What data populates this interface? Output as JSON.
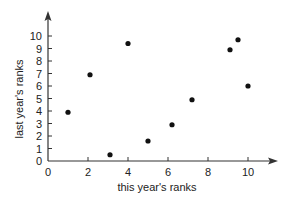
{
  "chart_data": {
    "type": "scatter",
    "title": "",
    "xlabel": "this year's ranks",
    "ylabel": "last year's ranks",
    "xlim": [
      0,
      11
    ],
    "ylim": [
      0,
      10.5
    ],
    "x_ticks": [
      0,
      2,
      4,
      6,
      8,
      10
    ],
    "y_ticks": [
      0,
      1,
      2,
      3,
      4,
      5,
      6,
      7,
      8,
      9,
      10
    ],
    "grid": false,
    "legend": null,
    "points": [
      {
        "x": 1.0,
        "y": 3.9
      },
      {
        "x": 2.1,
        "y": 6.9
      },
      {
        "x": 3.1,
        "y": 0.5
      },
      {
        "x": 4.0,
        "y": 9.4
      },
      {
        "x": 5.0,
        "y": 1.6
      },
      {
        "x": 6.2,
        "y": 2.9
      },
      {
        "x": 7.2,
        "y": 4.9
      },
      {
        "x": 9.1,
        "y": 8.9
      },
      {
        "x": 9.5,
        "y": 9.7
      },
      {
        "x": 10.0,
        "y": 6.0
      }
    ],
    "colors": {
      "axis": "#333333",
      "point": "#111111"
    }
  }
}
